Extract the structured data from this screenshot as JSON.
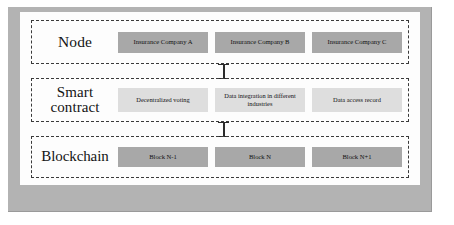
{
  "figure": {
    "background_color": "#b3b3b3",
    "panel_color": "#fdfdfd",
    "box_dark_color": "#a8a8a8",
    "box_light_color": "#dedede",
    "border_color": "#3a3a3a"
  },
  "tiers": [
    {
      "label": "Node",
      "boxes": [
        {
          "label": "Insurance Company A"
        },
        {
          "label": "Insurance Company B"
        },
        {
          "label": "Insurance Company C"
        }
      ]
    },
    {
      "label_line1": "Smart",
      "label_line2": "contract",
      "boxes": [
        {
          "label": "Decentralized voting"
        },
        {
          "label": "Data integration in different industries"
        },
        {
          "label": "Data access record"
        }
      ]
    },
    {
      "label": "Blockchain",
      "boxes": [
        {
          "label": "Block N-1"
        },
        {
          "label": "Block N"
        },
        {
          "label": "Block N+1"
        }
      ]
    }
  ]
}
